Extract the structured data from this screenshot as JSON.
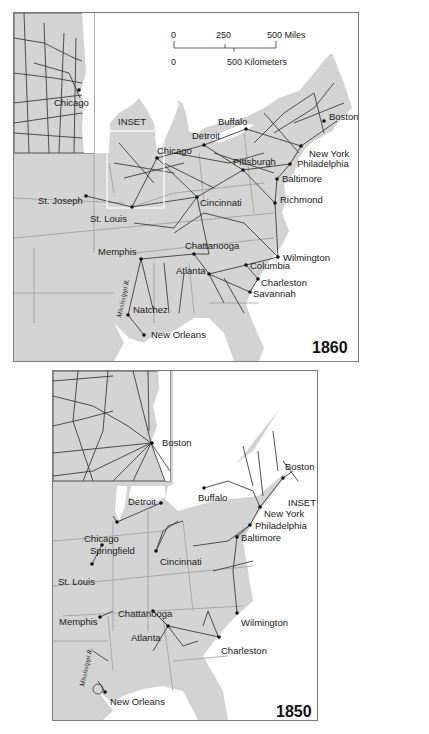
{
  "figure": {
    "maps": [
      {
        "year": "1860",
        "inset_label": "INSET",
        "inset_city": "Chicago",
        "scale": {
          "miles": [
            "0",
            "250",
            "500 Miles"
          ],
          "km": [
            "0",
            "500 Kilometers"
          ]
        },
        "river_label": "Mississippi R.",
        "cities": [
          {
            "name": "Boston",
            "x": 323,
            "y": 108
          },
          {
            "name": "Buffalo",
            "x": 232,
            "y": 116
          },
          {
            "name": "Detroit",
            "x": 190,
            "y": 132
          },
          {
            "name": "Chicago",
            "x": 143,
            "y": 145
          },
          {
            "name": "New York",
            "x": 287,
            "y": 133
          },
          {
            "name": "Pittsburgh",
            "x": 229,
            "y": 157
          },
          {
            "name": "Philadelphia",
            "x": 276,
            "y": 151
          },
          {
            "name": "Baltimore",
            "x": 263,
            "y": 166
          },
          {
            "name": "St. Joseph",
            "x": 72,
            "y": 183
          },
          {
            "name": "Cincinnati",
            "x": 183,
            "y": 184
          },
          {
            "name": "Richmond",
            "x": 261,
            "y": 190
          },
          {
            "name": "St. Louis",
            "x": 118,
            "y": 194
          },
          {
            "name": "Chattanooga",
            "x": 180,
            "y": 241
          },
          {
            "name": "Memphis",
            "x": 127,
            "y": 246
          },
          {
            "name": "Wilmington",
            "x": 264,
            "y": 244
          },
          {
            "name": "Columbia",
            "x": 232,
            "y": 252
          },
          {
            "name": "Atlanta",
            "x": 195,
            "y": 261
          },
          {
            "name": "Charleston",
            "x": 244,
            "y": 266
          },
          {
            "name": "Savannah",
            "x": 236,
            "y": 279
          },
          {
            "name": "Natchez",
            "x": 114,
            "y": 302
          },
          {
            "name": "New Orleans",
            "x": 130,
            "y": 322
          }
        ]
      },
      {
        "year": "1850",
        "inset_label": "INSET",
        "inset_city": "Boston",
        "river_label": "Mississippi R.",
        "cities": [
          {
            "name": "Boston",
            "x": 230,
            "y": 107
          },
          {
            "name": "Buffalo",
            "x": 151,
            "y": 117
          },
          {
            "name": "INSET",
            "x": 235,
            "y": 126
          },
          {
            "name": "Detroit",
            "x": 108,
            "y": 132
          },
          {
            "name": "New York",
            "x": 207,
            "y": 136
          },
          {
            "name": "Chicago",
            "x": 64,
            "y": 151
          },
          {
            "name": "Philadelphia",
            "x": 197,
            "y": 154
          },
          {
            "name": "Baltimore",
            "x": 184,
            "y": 166
          },
          {
            "name": "Springfield",
            "x": 49,
            "y": 174
          },
          {
            "name": "Cincinnati",
            "x": 103,
            "y": 180
          },
          {
            "name": "St. Louis",
            "x": 39,
            "y": 193
          },
          {
            "name": "Chattanooga",
            "x": 100,
            "y": 240
          },
          {
            "name": "Memphis",
            "x": 47,
            "y": 246
          },
          {
            "name": "Wilmington",
            "x": 184,
            "y": 242
          },
          {
            "name": "Atlanta",
            "x": 115,
            "y": 255
          },
          {
            "name": "Charleston",
            "x": 166,
            "y": 266
          },
          {
            "name": "New Orleans",
            "x": 52,
            "y": 321
          }
        ]
      }
    ]
  }
}
